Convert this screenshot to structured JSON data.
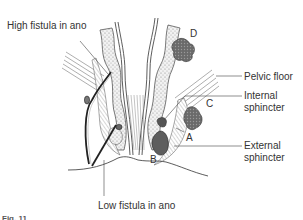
{
  "figure": {
    "type": "anatomical-diagram",
    "labels": {
      "high_fistula": "High fistula in ano",
      "low_fistula": "Low fistula in ano",
      "pelvic_floor": "Pelvic floor",
      "internal_sphincter_line1": "Internal",
      "internal_sphincter_line2": "sphincter",
      "external_sphincter_line1": "External",
      "external_sphincter_line2": "sphincter"
    },
    "markers": {
      "a": "A",
      "b": "B",
      "c": "C",
      "d": "D"
    },
    "caption": "Fig. 11"
  }
}
